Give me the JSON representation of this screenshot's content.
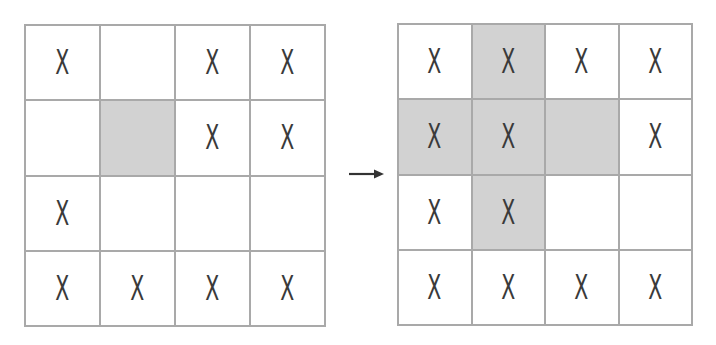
{
  "colors": {
    "grid_line": "#a9a9a9",
    "shaded_cell": "#d2d2d2",
    "empty_cell": "#ffffff",
    "mark": "#3a3a3a",
    "arrow": "#333333"
  },
  "arrow": {
    "icon": "right-arrow-icon"
  },
  "before": {
    "rows": [
      [
        {
          "mark": "X",
          "shaded": false
        },
        {
          "mark": "",
          "shaded": false
        },
        {
          "mark": "X",
          "shaded": false
        },
        {
          "mark": "X",
          "shaded": false
        }
      ],
      [
        {
          "mark": "",
          "shaded": false
        },
        {
          "mark": "",
          "shaded": true
        },
        {
          "mark": "X",
          "shaded": false
        },
        {
          "mark": "X",
          "shaded": false
        }
      ],
      [
        {
          "mark": "X",
          "shaded": false
        },
        {
          "mark": "",
          "shaded": false
        },
        {
          "mark": "",
          "shaded": false
        },
        {
          "mark": "",
          "shaded": false
        }
      ],
      [
        {
          "mark": "X",
          "shaded": false
        },
        {
          "mark": "X",
          "shaded": false
        },
        {
          "mark": "X",
          "shaded": false
        },
        {
          "mark": "X",
          "shaded": false
        }
      ]
    ]
  },
  "after": {
    "rows": [
      [
        {
          "mark": "X",
          "shaded": false
        },
        {
          "mark": "X",
          "shaded": true
        },
        {
          "mark": "X",
          "shaded": false
        },
        {
          "mark": "X",
          "shaded": false
        }
      ],
      [
        {
          "mark": "X",
          "shaded": true
        },
        {
          "mark": "X",
          "shaded": true
        },
        {
          "mark": "",
          "shaded": true
        },
        {
          "mark": "X",
          "shaded": false
        }
      ],
      [
        {
          "mark": "X",
          "shaded": false
        },
        {
          "mark": "X",
          "shaded": true
        },
        {
          "mark": "",
          "shaded": false
        },
        {
          "mark": "",
          "shaded": false
        }
      ],
      [
        {
          "mark": "X",
          "shaded": false
        },
        {
          "mark": "X",
          "shaded": false
        },
        {
          "mark": "X",
          "shaded": false
        },
        {
          "mark": "X",
          "shaded": false
        }
      ]
    ]
  }
}
